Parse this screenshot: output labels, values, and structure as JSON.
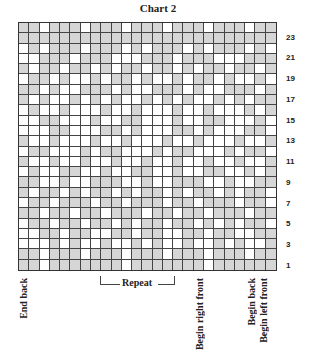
{
  "title": "Chart 2",
  "row_labels": [
    "23",
    "21",
    "19",
    "17",
    "15",
    "13",
    "11",
    "9",
    "7",
    "5",
    "3",
    "1"
  ],
  "bottom_labels": {
    "end_back": "End back",
    "repeat": "Repeat",
    "begin_right_front": "Begin right front",
    "begin_back": "Begin back",
    "begin_left_front": "Begin left front"
  },
  "colors": {
    "shaded": "#d6d6d6",
    "blank": "#ffffff",
    "line": "#444444"
  },
  "chart_data": {
    "type": "heatmap",
    "title": "Chart 2",
    "rows": 24,
    "cols": 25,
    "legend": {
      "1": "shaded (contrast color)",
      "0": "blank (main color)"
    },
    "row_numbers_shown": [
      23,
      21,
      19,
      17,
      15,
      13,
      11,
      9,
      7,
      5,
      3,
      1
    ],
    "grid_top_to_bottom": [
      "1101110111011101110111011",
      "1111111111111111111111111",
      "0101110111010111010111010",
      "0011101110001110111000111",
      "1011011010110110101101101",
      "0110100101101001011010010",
      "1101001110100111010011101",
      "1010010101001010100101011",
      "0100100010010001001000101",
      "0011000100110001001100010",
      "0001100011010001101000110",
      "1001000100100010010001001",
      "0110001011000101100010110",
      "1001001001001001001001001",
      "0100110010011001001100101",
      "1100100111001001110010011",
      "1011010110101101011010110",
      "0110111011011101101110110",
      "1101101101110110110111011",
      "0110110110101101101010110",
      "0011011001101100110110011",
      "0001010010010100100101001",
      "1101110111011101110111011",
      "1101111111011111110111111"
    ],
    "annotations": [
      "End back",
      "Repeat",
      "Begin right front",
      "Begin back",
      "Begin left front"
    ]
  }
}
